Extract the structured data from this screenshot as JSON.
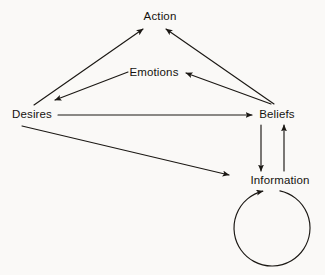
{
  "diagram": {
    "background_color": "#faf9f7",
    "ink_color": "#1b1814",
    "text_color": "#15130f",
    "nodes": [
      {
        "id": "action",
        "label": "Action",
        "x": 160,
        "y": 17
      },
      {
        "id": "emotions",
        "label": "Emotions",
        "x": 154,
        "y": 73
      },
      {
        "id": "desires",
        "label": "Desires",
        "x": 32,
        "y": 115
      },
      {
        "id": "beliefs",
        "label": "Beliefs",
        "x": 277,
        "y": 115
      },
      {
        "id": "information",
        "label": "Information",
        "x": 280,
        "y": 181
      }
    ],
    "edges": [
      {
        "id": "desires-to-action",
        "from": "Desires",
        "to": "Action",
        "kind": "arrow",
        "x1": 34,
        "y1": 105,
        "x2": 143,
        "y2": 29
      },
      {
        "id": "beliefs-to-action",
        "from": "Beliefs",
        "to": "Action",
        "kind": "arrow",
        "x1": 274,
        "y1": 104,
        "x2": 166,
        "y2": 29
      },
      {
        "id": "emotions-to-desires",
        "from": "Emotions",
        "to": "Desires",
        "kind": "arrow",
        "x1": 128,
        "y1": 72,
        "x2": 55,
        "y2": 100
      },
      {
        "id": "beliefs-to-emotions",
        "from": "Beliefs",
        "to": "Emotions",
        "kind": "arrow",
        "x1": 271,
        "y1": 104,
        "x2": 186,
        "y2": 73
      },
      {
        "id": "desires-to-beliefs",
        "from": "Desires",
        "to": "Beliefs",
        "kind": "arrow",
        "x1": 58,
        "y1": 115,
        "x2": 252,
        "y2": 115
      },
      {
        "id": "desires-to-information",
        "from": "Desires",
        "to": "Information",
        "kind": "arrow",
        "x1": 22,
        "y1": 126,
        "x2": 229,
        "y2": 175
      },
      {
        "id": "beliefs-to-information",
        "from": "Beliefs",
        "to": "Information",
        "kind": "arrow",
        "x1": 261,
        "y1": 125,
        "x2": 261,
        "y2": 171
      },
      {
        "id": "information-to-beliefs",
        "from": "Information",
        "to": "Beliefs",
        "kind": "arrow",
        "x1": 284,
        "y1": 171,
        "x2": 284,
        "y2": 125
      }
    ],
    "loop": {
      "id": "information-self-loop",
      "label": "Information feedback loop",
      "center_x": 272,
      "center_y": 228,
      "radius": 38,
      "gap_start_deg": -78,
      "gap_end_deg": -104
    }
  }
}
